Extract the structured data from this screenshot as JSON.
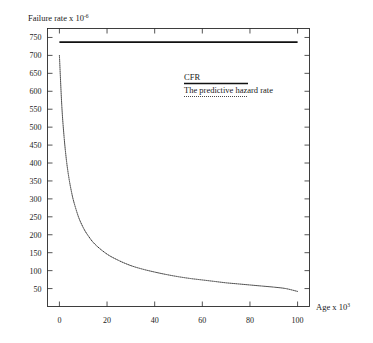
{
  "chart_data": {
    "type": "line",
    "title": "",
    "ylabel": "Failure rate x 10",
    "ylabel_exponent": "-6",
    "xlabel": "Age x 10",
    "xlabel_exponent": "3",
    "xlim": [
      -5,
      105
    ],
    "ylim": [
      0,
      775
    ],
    "xticks": [
      0,
      20,
      40,
      60,
      80,
      100
    ],
    "xtick_labels": [
      "0",
      "20",
      "40",
      "60",
      "80",
      "100"
    ],
    "yticks": [
      50,
      100,
      150,
      200,
      250,
      300,
      350,
      400,
      450,
      500,
      550,
      600,
      650,
      700,
      750
    ],
    "ytick_labels": [
      "50",
      "100",
      "150",
      "200",
      "250",
      "300",
      "350",
      "400",
      "450",
      "500",
      "550",
      "600",
      "650",
      "700",
      "750"
    ],
    "grid": false,
    "legend_position": "upper-right-inside",
    "series": [
      {
        "name": "CFR",
        "style": "solid",
        "color": "#111111",
        "x": [
          0,
          100
        ],
        "values": [
          737,
          737
        ]
      },
      {
        "name": "The predictive hazard rate",
        "style": "dotted",
        "color": "#333333",
        "x": [
          0,
          1,
          2,
          3,
          4,
          5,
          6,
          8,
          10,
          12,
          15,
          20,
          25,
          30,
          35,
          40,
          45,
          50,
          55,
          60,
          65,
          70,
          75,
          80,
          85,
          90,
          95,
          100
        ],
        "values": [
          700,
          560,
          470,
          405,
          358,
          322,
          293,
          250,
          220,
          198,
          173,
          146,
          128,
          114,
          104,
          96,
          89,
          83,
          78,
          74,
          70,
          66,
          63,
          60,
          57,
          54,
          50,
          42
        ]
      }
    ]
  },
  "legend": {
    "entries": [
      {
        "label": "CFR",
        "style": "solid"
      },
      {
        "label": "The predictive hazard rate",
        "style": "dotted"
      }
    ]
  }
}
